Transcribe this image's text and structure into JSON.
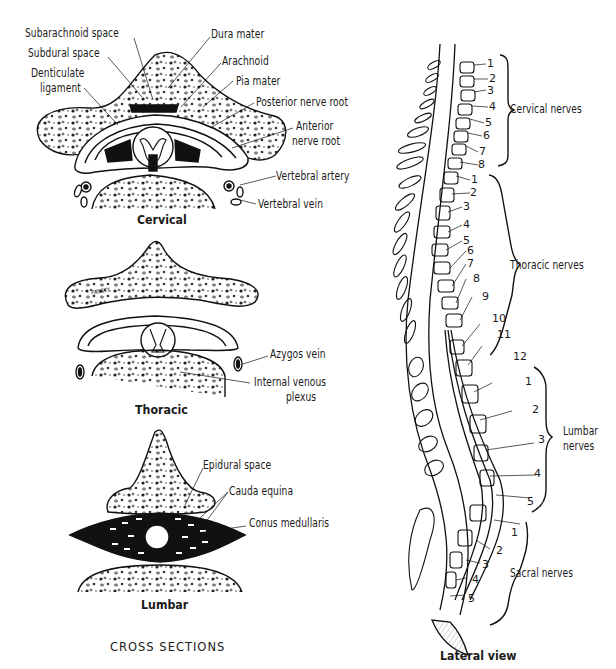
{
  "figure": {
    "cross_sections_title": "CROSS SECTIONS",
    "lateral_view_title": "Lateral view",
    "artist_signature": "PANSKY"
  },
  "cervical": {
    "caption": "Cervical",
    "labels": {
      "subarachnoid_space": "Subarachnoid space",
      "subdural_space": "Subdural space",
      "denticulate_ligament_1": "Denticulate",
      "denticulate_ligament_2": "ligament",
      "dura_mater": "Dura mater",
      "arachnoid": "Arachnoid",
      "pia_mater": "Pia mater",
      "posterior_nerve_root": "Posterior nerve root",
      "anterior_nerve_root_1": "Anterior",
      "anterior_nerve_root_2": "nerve root",
      "vertebral_artery": "Vertebral artery",
      "vertebral_vein": "Vertebral vein"
    }
  },
  "thoracic": {
    "caption": "Thoracic",
    "labels": {
      "azygos_vein": "Azygos vein",
      "internal_venous_plexus_1": "Internal venous",
      "internal_venous_plexus_2": "plexus"
    }
  },
  "lumbar": {
    "caption": "Lumbar",
    "labels": {
      "epidural_space": "Epidural space",
      "cauda_equina": "Cauda equina",
      "conus_medullaris": "Conus medullaris"
    }
  },
  "lateral": {
    "groups": [
      {
        "name": "Cervical nerves",
        "numbers": [
          "1",
          "2",
          "3",
          "4",
          "5",
          "6",
          "7",
          "8"
        ]
      },
      {
        "name": "Thoracic nerves",
        "numbers": [
          "1",
          "2",
          "3",
          "4",
          "5",
          "6",
          "7",
          "8",
          "9",
          "10",
          "11",
          "12"
        ]
      },
      {
        "name_1": "Lumbar",
        "name_2": "nerves",
        "numbers": [
          "1",
          "2",
          "3",
          "4",
          "5"
        ]
      },
      {
        "name": "Sacral nerves",
        "numbers": [
          "1",
          "2",
          "3",
          "4",
          "5"
        ]
      }
    ]
  }
}
